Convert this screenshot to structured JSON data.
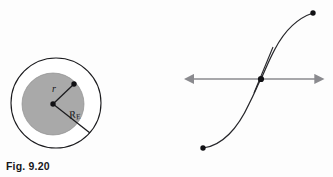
{
  "page": {
    "background_color": "#fdfdfd",
    "width": 333,
    "height": 177
  },
  "figures": [
    {
      "id": "fig-9-20",
      "caption": "Fig. 9.20",
      "description": "Earth cross-section: outer circle of radius R_E with inner shaded sphere of radius r",
      "colors": {
        "stroke": "#1b1b1e",
        "inner_fill": "#a9a9a9",
        "outer_fill": "#ffffff"
      },
      "geometry": {
        "outer_circle": {
          "cx": 56,
          "cy": 103,
          "r": 45
        },
        "inner_circle": {
          "cx": 53,
          "cy": 104,
          "r": 31
        },
        "center_dot": {
          "cx": 53,
          "cy": 104,
          "r": 2.6
        },
        "r_endpoint_dot": {
          "cx": 74,
          "cy": 84,
          "r": 2.6
        },
        "RE_endpoint": {
          "x": 89,
          "y": 132
        }
      },
      "labels": [
        {
          "name": "radius-r-label",
          "text": "r"
        },
        {
          "name": "radius-RE-label",
          "text": "R",
          "sub": "E"
        }
      ]
    },
    {
      "id": "fig-9-21",
      "caption": "Fig. 9.21",
      "description": "S-shaped path from O to B crossing a horizontal force axis at mass m, with gravitational force F_G pointing left and applied force F_A pointing right",
      "colors": {
        "curve_stroke": "#26262a",
        "arrow_stroke": "#8a8a8e",
        "dot_fill": "#111114"
      },
      "geometry": {
        "force_axis": {
          "x1": 192,
          "x2": 318,
          "y": 79
        },
        "point_O": {
          "cx": 203,
          "cy": 148,
          "r": 2.6
        },
        "point_B": {
          "cx": 313,
          "cy": 13,
          "r": 2.6
        },
        "point_m": {
          "cx": 261,
          "cy": 79,
          "r": 3.0
        },
        "dl_segment": {
          "x1": 254,
          "y1": 92,
          "x2": 272,
          "y2": 48
        }
      },
      "labels": [
        {
          "name": "force-gravity-label",
          "text": "F",
          "sub": "G"
        },
        {
          "name": "force-applied-label",
          "text": "F",
          "sub": "A"
        },
        {
          "name": "element-dl-label",
          "text": "d",
          "bold": "l"
        },
        {
          "name": "mass-m-label",
          "text": "m"
        },
        {
          "name": "point-b-label",
          "text": "B"
        },
        {
          "name": "point-o-label",
          "text": "O"
        }
      ]
    }
  ],
  "fig920": {
    "caption": "Fig. 9.20",
    "label_r": "r",
    "label_R": "R",
    "label_R_sub": "E"
  },
  "fig921": {
    "caption": "Fig. 9.21",
    "label_F": "F",
    "label_FG_sub": "G",
    "label_FA_sub": "A",
    "label_d": "d",
    "label_l": "l",
    "label_m": "m",
    "label_B": "B",
    "label_O": "O"
  }
}
